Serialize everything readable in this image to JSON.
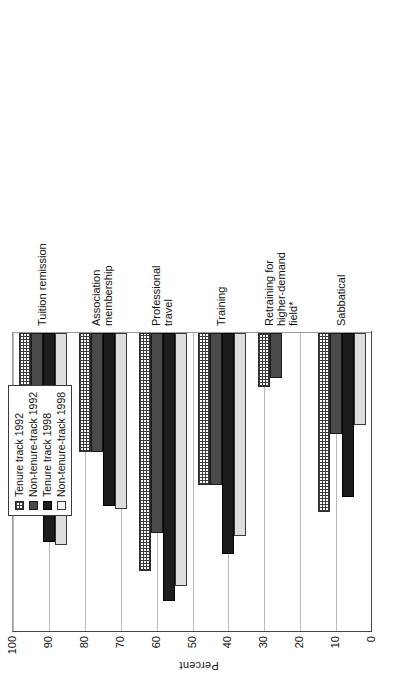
{
  "chart_data": {
    "type": "bar",
    "orientation": "horizontal",
    "title": "",
    "xlabel": "",
    "ylabel": "Percent",
    "ylim": [
      0,
      100
    ],
    "ytick_step": 10,
    "yticks": [
      "100",
      "90",
      "80",
      "70",
      "60",
      "50",
      "40",
      "30",
      "20",
      "10",
      "0"
    ],
    "grid": true,
    "legend_position": "top-center",
    "categories": [
      "Tuition remission",
      "Association\nmembership",
      "Professional\ntravel",
      "Training",
      "Retraining for\nhigher-demand\nfield*",
      "Sabbatical"
    ],
    "series": [
      {
        "name": "Tenure track 1992",
        "pattern": "cross-hatch",
        "values": [
          54,
          40,
          80,
          51,
          18,
          60
        ]
      },
      {
        "name": "Non-tenure-track 1992",
        "pattern": "dark-gray",
        "values": [
          57,
          40,
          67,
          51,
          15,
          34
        ]
      },
      {
        "name": "Tenure track 1998",
        "pattern": "black",
        "values": [
          70,
          58,
          90,
          74,
          0,
          55
        ]
      },
      {
        "name": "Non-tenure-track 1998",
        "pattern": "light-gray",
        "values": [
          71,
          59,
          85,
          68,
          0,
          31
        ]
      }
    ]
  },
  "legend": {
    "items": [
      {
        "label": "Tenure track 1992"
      },
      {
        "label": "Non-tenure-track 1992"
      },
      {
        "label": "Tenure track 1998"
      },
      {
        "label": "Non-tenure-track 1998"
      }
    ]
  },
  "axis": {
    "value_axis_title": "Percent"
  },
  "caption": {
    "text": ""
  },
  "colors": {
    "axis": "#444444",
    "gridline": "#b9b9b9",
    "series_1": "#3a3a3a",
    "series_2": "#4a4a4a",
    "series_3": "#1d1d1d",
    "series_4": "#dedede",
    "background": "#ffffff"
  }
}
